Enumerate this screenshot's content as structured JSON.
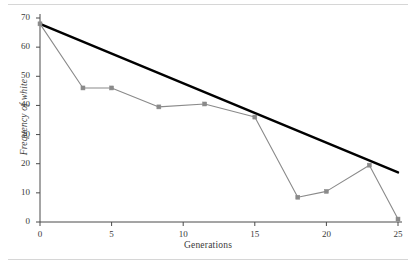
{
  "chart_data": {
    "type": "line",
    "title": "",
    "xlabel": "Generations",
    "ylabel": "Frequency of white",
    "xlim": [
      0,
      25
    ],
    "ylim": [
      0,
      70
    ],
    "xticks": [
      0,
      5,
      10,
      15,
      20,
      25
    ],
    "yticks": [
      0,
      10,
      20,
      30,
      40,
      50,
      60,
      70
    ],
    "grid": false,
    "legend": "none",
    "series": [
      {
        "name": "Observed frequency of white",
        "color": "#8a8a8a",
        "marker": "square",
        "x": [
          0,
          3,
          5,
          8.3,
          11.5,
          15,
          18,
          20,
          23,
          25
        ],
        "values": [
          68,
          46,
          46,
          39.5,
          40.5,
          36,
          8.5,
          10.5,
          19.5,
          1
        ]
      },
      {
        "name": "Linear trend line",
        "color": "#000000",
        "marker": "none",
        "x": [
          0,
          25
        ],
        "values": [
          68,
          17
        ]
      }
    ]
  },
  "axes": {
    "x_tick_labels": [
      "0",
      "5",
      "10",
      "15",
      "20",
      "25"
    ],
    "y_tick_labels": [
      "0",
      "10",
      "20",
      "30",
      "40",
      "50",
      "60",
      "70"
    ],
    "x_axis_title": "Generations",
    "y_axis_title": "Frequency of white"
  },
  "colors": {
    "data_line": "#8a8a8a",
    "trend_line": "#000000",
    "axis": "#4a4a4a",
    "rule": "#d6d6d6",
    "background": "#ffffff"
  }
}
